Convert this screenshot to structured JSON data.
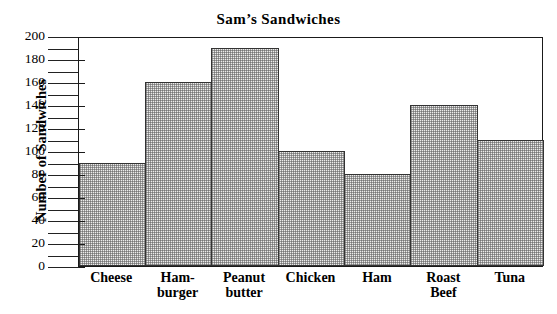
{
  "chart_data": {
    "type": "bar",
    "title": "Sam’s Sandwiches",
    "xlabel": "",
    "ylabel": "Number of Sandwiches",
    "categories": [
      "Cheese",
      "Ham-\nburger",
      "Peanut\nbutter",
      "Chicken",
      "Ham",
      "Roast\nBeef",
      "Tuna"
    ],
    "values": [
      90,
      160,
      190,
      100,
      80,
      140,
      110
    ],
    "ylim": [
      0,
      200
    ],
    "ytick_step": 20,
    "yticks": [
      0,
      20,
      40,
      60,
      80,
      100,
      120,
      140,
      160,
      180,
      200
    ],
    "ytick_labels": [
      "0",
      "20",
      "40",
      "60",
      "80",
      "100",
      "120",
      "140",
      "160",
      "180",
      "200"
    ],
    "grid": false,
    "legend": false,
    "bar_fill": "#ececeb",
    "bar_edge": "#333333",
    "axis_color": "#1a1a1a"
  }
}
